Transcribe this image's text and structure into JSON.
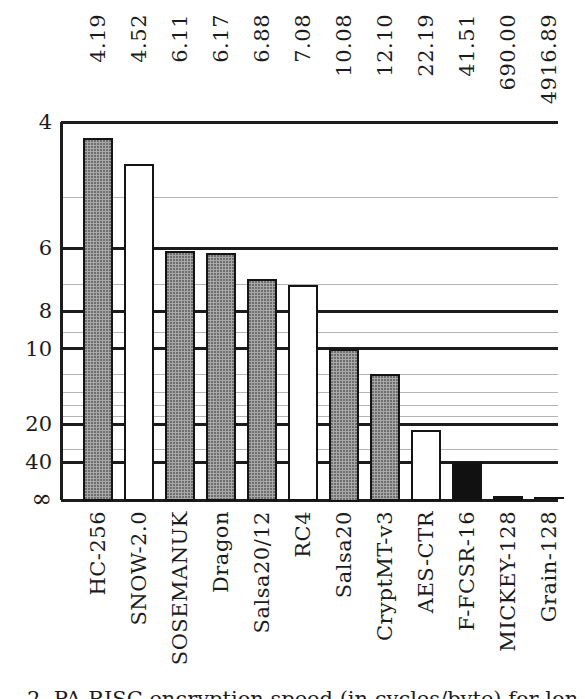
{
  "chart_data": {
    "type": "bar",
    "title": "",
    "xlabel": "",
    "ylabel": "",
    "categories": [
      "HC-256",
      "SNOW-2.0",
      "SOSEMANUK",
      "Dragon",
      "Salsa20/12",
      "RC4",
      "Salsa20",
      "CryptMT-v3",
      "AES-CTR",
      "F-FCSR-16",
      "MICKEY-128",
      "Grain-128"
    ],
    "values": [
      4.19,
      4.52,
      6.11,
      6.17,
      6.88,
      7.08,
      10.08,
      12.1,
      22.19,
      41.51,
      690.0,
      4916.89
    ],
    "value_labels": [
      "4.19",
      "4.52",
      "6.11",
      "6.17",
      "6.88",
      "7.08",
      "10.08",
      "12.10",
      "22.19",
      "41.51",
      "690.00",
      "4916.89"
    ],
    "bar_styles": [
      "gray",
      "white",
      "gray",
      "gray",
      "gray",
      "white",
      "gray",
      "gray",
      "white",
      "black",
      "black",
      "black"
    ],
    "yaxis": {
      "scale": "reciprocal (1/value, lower value = taller bar)",
      "top_value": 4,
      "major_ticks": [
        {
          "label": "4",
          "value": 4
        },
        {
          "label": "6",
          "value": 6
        },
        {
          "label": "8",
          "value": 8
        },
        {
          "label": "10",
          "value": 10
        },
        {
          "label": "20",
          "value": 20
        },
        {
          "label": "40",
          "value": 40
        },
        {
          "label": "∞",
          "value": null
        }
      ],
      "minor_gridlines": [
        5,
        7,
        9,
        12,
        14,
        16,
        18,
        30
      ],
      "grid": true
    },
    "legend": null
  },
  "caption": {
    "text": "2. PA-RISC encryption speed (in cycles/byte) for lon"
  },
  "colors": {
    "background": "#ffffff",
    "major_grid": "#1c1c1c",
    "minor_grid": "#b4b4b4",
    "bar_gray": "#a8a8a8",
    "bar_white": "#ffffff",
    "bar_black": "#111111",
    "text": "#1c1c1c"
  }
}
